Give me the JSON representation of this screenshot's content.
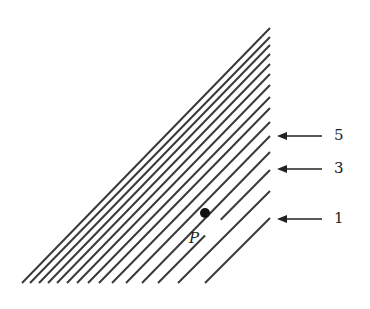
{
  "diagram": {
    "line_color": "#3a3a3a",
    "bottom_y": 283,
    "right_x": 270,
    "lines": [
      {
        "right_y": 218,
        "bottom_x": 205
      },
      {
        "right_y": 191,
        "bottom_x": 178
      },
      {
        "right_y": 170,
        "bottom_x": 158
      },
      {
        "right_y": 152,
        "bottom_x": 142
      },
      {
        "right_y": 136,
        "bottom_x": 126
      },
      {
        "right_y": 122,
        "bottom_x": 112
      },
      {
        "right_y": 108,
        "bottom_x": 99
      },
      {
        "right_y": 97,
        "bottom_x": 88
      },
      {
        "right_y": 85,
        "bottom_x": 77
      },
      {
        "right_y": 74,
        "bottom_x": 67
      },
      {
        "right_y": 64,
        "bottom_x": 57
      },
      {
        "right_y": 54,
        "bottom_x": 48
      },
      {
        "right_y": 45,
        "bottom_x": 39
      },
      {
        "right_y": 37,
        "bottom_x": 30
      },
      {
        "right_y": 28,
        "bottom_x": 22
      }
    ],
    "arrows": [
      {
        "label": "5",
        "y": 136
      },
      {
        "label": "3",
        "y": 169
      },
      {
        "label": "1",
        "y": 219
      }
    ],
    "point": {
      "label": "P",
      "x": 205,
      "y": 213
    }
  }
}
